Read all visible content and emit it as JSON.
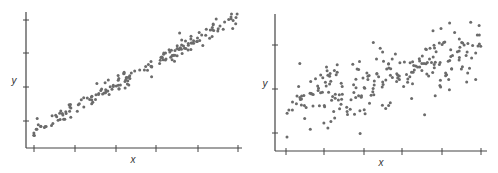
{
  "colors": {
    "point": "#6b6b6b",
    "axis": "#444444",
    "background": "#ffffff"
  },
  "chart_data": [
    {
      "type": "scatter",
      "title": "",
      "xlabel": "x",
      "ylabel": "y",
      "grid": false,
      "legend": null,
      "description": "Strong positive linear relationship; points tightly clustered along a straight line",
      "x_ticks": 6,
      "y_ticks": 4,
      "xlim": [
        0,
        10
      ],
      "ylim": [
        0,
        10
      ],
      "trend": {
        "slope": 0.85,
        "intercept": 1.0,
        "noise": 0.35
      },
      "n_points": 180
    },
    {
      "type": "scatter",
      "title": "",
      "xlabel": "x",
      "ylabel": "y",
      "grid": false,
      "legend": null,
      "description": "Moderate positive relationship; points widely scattered around an upward trend",
      "x_ticks": 6,
      "y_ticks": 3,
      "xlim": [
        0,
        10
      ],
      "ylim": [
        0,
        10
      ],
      "trend": {
        "slope": 0.45,
        "intercept": 3.6,
        "noise": 1.3
      },
      "n_points": 230
    }
  ],
  "plots": [
    {
      "x_label": "x",
      "y_label": "y",
      "frame": {
        "ox": 26,
        "oy": 148,
        "xend": 242,
        "ytop": 12
      },
      "x_ticks_px": [
        34,
        75,
        116,
        156,
        198,
        238
      ],
      "y_ticks_px": [
        121,
        87,
        53,
        20
      ],
      "label_pos": {
        "x": [
          133,
          163
        ],
        "y": [
          14,
          84
        ]
      },
      "points_area": {
        "x0": 33,
        "x1": 238,
        "y_at_x0": 132,
        "y_at_x1": 16,
        "spread": 4
      }
    },
    {
      "x_label": "x",
      "y_label": "y",
      "frame": {
        "ox": 275,
        "oy": 151,
        "xend": 487,
        "ytop": 14
      },
      "x_ticks_px": [
        286,
        324,
        364,
        402,
        442,
        481
      ],
      "y_ticks_px": [
        133,
        89,
        45
      ],
      "label_pos": {
        "x": [
          381,
          166
        ],
        "y": [
          265,
          87
        ]
      },
      "points_area": {
        "x0": 285,
        "x1": 481,
        "y_at_x0": 105,
        "y_at_x1": 50,
        "spread": 16
      }
    }
  ]
}
